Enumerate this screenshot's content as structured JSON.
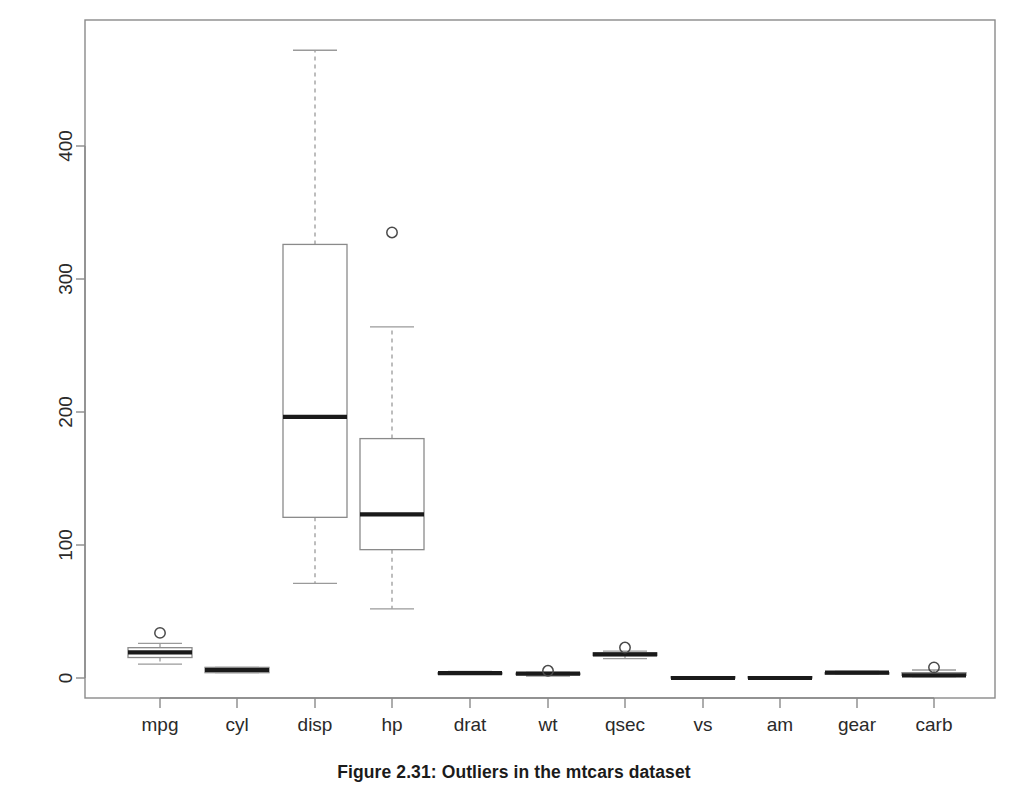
{
  "figure": {
    "caption": "Figure 2.31: Outliers in the mtcars dataset",
    "background_color": "#ffffff",
    "frame_color": "#8a8a8a",
    "box_color": "#8a8a8a",
    "median_color": "#1a1a1a",
    "whisker_color": "#9a9a9a",
    "outlier_color": "#4a4a4a"
  },
  "chart_data": {
    "type": "box",
    "title": "",
    "subtitle": "",
    "xlabel": "",
    "ylabel": "",
    "grid": false,
    "legend": "none",
    "ylim": [
      -20,
      485
    ],
    "yticks": [
      0,
      100,
      200,
      300,
      400
    ],
    "ytick_labels": [
      "0",
      "100",
      "200",
      "300",
      "400"
    ],
    "categories": [
      "mpg",
      "cyl",
      "disp",
      "hp",
      "drat",
      "wt",
      "qsec",
      "vs",
      "am",
      "gear",
      "carb"
    ],
    "boxes": [
      {
        "name": "mpg",
        "whisker_low": 10.4,
        "q1": 15.4,
        "median": 19.2,
        "q3": 22.8,
        "whisker_high": 26.0,
        "outliers": [
          33.9
        ]
      },
      {
        "name": "cyl",
        "whisker_low": 4,
        "q1": 4,
        "median": 6,
        "q3": 8,
        "whisker_high": 8,
        "outliers": []
      },
      {
        "name": "disp",
        "whisker_low": 71.1,
        "q1": 120.8,
        "median": 196.3,
        "q3": 326.0,
        "whisker_high": 472.0,
        "outliers": []
      },
      {
        "name": "hp",
        "whisker_low": 52,
        "q1": 96.5,
        "median": 123,
        "q3": 180,
        "whisker_high": 264,
        "outliers": [
          335
        ]
      },
      {
        "name": "drat",
        "whisker_low": 2.76,
        "q1": 3.08,
        "median": 3.695,
        "q3": 3.92,
        "whisker_high": 4.93,
        "outliers": []
      },
      {
        "name": "wt",
        "whisker_low": 1.513,
        "q1": 2.581,
        "median": 3.325,
        "q3": 3.61,
        "whisker_high": 4.25,
        "outliers": [
          5.424
        ]
      },
      {
        "name": "qsec",
        "whisker_low": 14.5,
        "q1": 16.89,
        "median": 17.71,
        "q3": 18.9,
        "whisker_high": 20.22,
        "outliers": [
          22.9
        ]
      },
      {
        "name": "vs",
        "whisker_low": 0,
        "q1": 0,
        "median": 0,
        "q3": 1,
        "whisker_high": 1,
        "outliers": []
      },
      {
        "name": "am",
        "whisker_low": 0,
        "q1": 0,
        "median": 0,
        "q3": 1,
        "whisker_high": 1,
        "outliers": []
      },
      {
        "name": "gear",
        "whisker_low": 3,
        "q1": 3,
        "median": 4,
        "q3": 4,
        "whisker_high": 5,
        "outliers": []
      },
      {
        "name": "carb",
        "whisker_low": 1,
        "q1": 2,
        "median": 2,
        "q3": 4,
        "whisker_high": 6,
        "outliers": [
          8
        ]
      }
    ]
  }
}
